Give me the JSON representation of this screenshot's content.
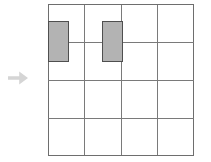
{
  "figure": {
    "title": "",
    "type": "grid-diagram"
  },
  "arrow": {
    "name": "right-arrow-marker",
    "direction": "right",
    "color": "#d5d5d5",
    "x": 6,
    "y": 67,
    "width": 24,
    "height": 22
  },
  "grid": {
    "origin_x": 48,
    "origin_y": 4,
    "width": 146,
    "height": 152,
    "columns": 4,
    "rows": 4,
    "cell_width": 36.5,
    "cell_height": 38,
    "border_color": "#6e6e6e",
    "line_color": "#7a7a7a",
    "line_width": 1,
    "background": "#ffffff",
    "x_positions": [
      0,
      36.5,
      73,
      109.5,
      146
    ],
    "y_positions": [
      0,
      38,
      76,
      114,
      152
    ]
  },
  "blocks": [
    {
      "name": "shaded-block-left",
      "col": 0,
      "row_span_from": 0,
      "x": 0,
      "y": 17,
      "width": 20,
      "height": 40,
      "fill": "#b3b3b3",
      "stroke": "#4f4f4f",
      "stroke_width": 1
    },
    {
      "name": "shaded-block-right",
      "col": 1,
      "row_span_from": 0,
      "x": 54,
      "y": 17,
      "width": 20,
      "height": 40,
      "fill": "#b3b3b3",
      "stroke": "#4f4f4f",
      "stroke_width": 1
    }
  ],
  "chart_data": {
    "type": "heatmap",
    "title": "",
    "xlabel": "",
    "ylabel": "",
    "grid": true,
    "columns": 4,
    "rows": 4,
    "categories": [
      "c1",
      "c2",
      "c3",
      "c4"
    ],
    "row_labels": [
      "r1",
      "r2",
      "r3",
      "r4"
    ],
    "values": [
      [
        1,
        1,
        0,
        0
      ],
      [
        1,
        1,
        0,
        0
      ],
      [
        0,
        0,
        0,
        0
      ],
      [
        0,
        0,
        0,
        0
      ]
    ],
    "legend": [],
    "annotations": [
      "right-arrow-marker at left of grid"
    ]
  }
}
